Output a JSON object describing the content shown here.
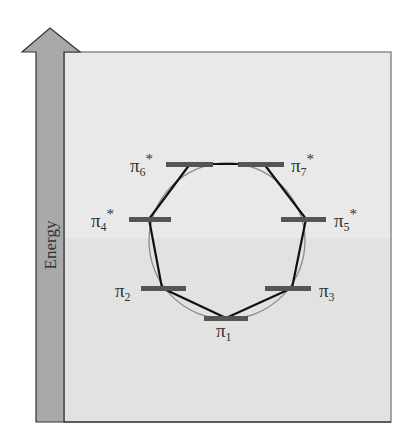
{
  "diagram": {
    "axis_label": "Energy",
    "colors": {
      "background": "#ffffff",
      "panel_top": "#e9e9e9",
      "panel_bottom": "#e2e2e2",
      "panel_border": "#888888",
      "arrow_fill": "#a9a9a9",
      "arrow_border": "#333333",
      "level_bar": "#555555",
      "polygon": "#111111",
      "circle": "#8a8a8a",
      "label": "#333333"
    },
    "levels": [
      {
        "id": "pi1",
        "base": "π",
        "sub": "1",
        "star": "",
        "x1": 204,
        "x2": 248,
        "y": 318,
        "label_x": 226,
        "label_y": 337,
        "anchor": "middle"
      },
      {
        "id": "pi2",
        "base": "π",
        "sub": "2",
        "star": "",
        "x1": 141,
        "x2": 186,
        "y": 288,
        "label_x": 114,
        "label_y": 297,
        "anchor": "start"
      },
      {
        "id": "pi3",
        "base": "π",
        "sub": "3",
        "star": "",
        "x1": 265,
        "x2": 311,
        "y": 288,
        "label_x": 318,
        "label_y": 297,
        "anchor": "start"
      },
      {
        "id": "pi4",
        "base": "π",
        "sub": "4",
        "star": "*",
        "x1": 129,
        "x2": 171,
        "y": 219,
        "label_x": 90,
        "label_y": 227,
        "anchor": "start"
      },
      {
        "id": "pi5",
        "base": "π",
        "sub": "5",
        "star": "*",
        "x1": 281,
        "x2": 326,
        "y": 219,
        "label_x": 333,
        "label_y": 227,
        "anchor": "start"
      },
      {
        "id": "pi6",
        "base": "π",
        "sub": "6",
        "star": "*",
        "x1": 166,
        "x2": 213,
        "y": 164,
        "label_x": 130,
        "label_y": 172,
        "anchor": "start"
      },
      {
        "id": "pi7",
        "base": "π",
        "sub": "7",
        "star": "*",
        "x1": 238,
        "x2": 284,
        "y": 164,
        "label_x": 291,
        "label_y": 172,
        "anchor": "start"
      }
    ],
    "polygon_vertices": [
      [
        226,
        318
      ],
      [
        292,
        288
      ],
      [
        306,
        219
      ],
      [
        264,
        164
      ],
      [
        190,
        164
      ],
      [
        149,
        219
      ],
      [
        162,
        288
      ]
    ],
    "circle": {
      "cx": 227,
      "cy": 241,
      "r": 78
    }
  }
}
